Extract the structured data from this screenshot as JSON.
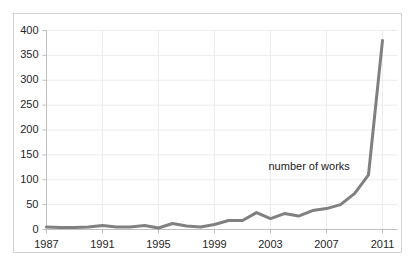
{
  "chart_data": {
    "type": "line",
    "title": "",
    "subtitle": "",
    "xlabel": "",
    "ylabel": "",
    "grid": true,
    "legend_position": "inline-annotation",
    "annotations": [
      {
        "text": "number of works",
        "x": 2004,
        "y": 125
      }
    ],
    "series": [
      {
        "name": "number of works",
        "color": "#808080",
        "x": [
          1987,
          1988,
          1989,
          1990,
          1991,
          1992,
          1993,
          1994,
          1995,
          1996,
          1997,
          1998,
          1999,
          2000,
          2001,
          2002,
          2003,
          2004,
          2005,
          2006,
          2007,
          2008,
          2009,
          2010,
          2011
        ],
        "values": [
          5,
          4,
          4,
          5,
          8,
          5,
          5,
          8,
          3,
          12,
          7,
          5,
          10,
          18,
          18,
          34,
          22,
          32,
          27,
          38,
          42,
          50,
          72,
          110,
          380
        ]
      }
    ],
    "x": [
      1987,
      1988,
      1989,
      1990,
      1991,
      1992,
      1993,
      1994,
      1995,
      1996,
      1997,
      1998,
      1999,
      2000,
      2001,
      2002,
      2003,
      2004,
      2005,
      2006,
      2007,
      2008,
      2009,
      2010,
      2011
    ],
    "values": [
      5,
      4,
      4,
      5,
      8,
      5,
      5,
      8,
      3,
      12,
      7,
      5,
      10,
      18,
      18,
      34,
      22,
      32,
      27,
      38,
      42,
      50,
      72,
      110,
      380
    ],
    "xlim": [
      1987,
      2011
    ],
    "ylim": [
      0,
      400
    ],
    "ytick_labels": [
      "400",
      "350",
      "300",
      "250",
      "200",
      "150",
      "100",
      "50",
      "0"
    ],
    "ytick_values": [
      400,
      350,
      300,
      250,
      200,
      150,
      100,
      50,
      0
    ],
    "xtick_labels": [
      "1987",
      "1991",
      "1995",
      "1999",
      "2003",
      "2007",
      "2011"
    ],
    "xtick_values": [
      1987,
      1991,
      1995,
      1999,
      2003,
      2007,
      2011
    ]
  },
  "colors": {
    "line": "#808080",
    "grid": "#ececec",
    "axis": "#bfbfbf",
    "text": "#262626",
    "frame": "#d2d2d2",
    "background": "#ffffff"
  }
}
